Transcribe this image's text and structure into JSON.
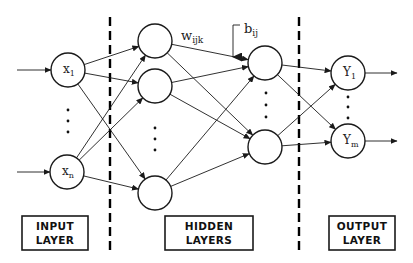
{
  "diagram": {
    "colors": {
      "stroke": "#1a1a1a",
      "background": "#ffffff"
    },
    "node_radius": 17,
    "layers": [
      {
        "id": "input",
        "box_label_line1": "INPUT",
        "box_label_line2": "LAYER",
        "box": {
          "x": 22,
          "y": 216,
          "w": 66,
          "h": 34
        },
        "nodes": [
          {
            "id": "x1",
            "cx": 68,
            "cy": 70,
            "label": "x",
            "sub": "1"
          },
          {
            "id": "xn",
            "cx": 67,
            "cy": 172,
            "label": "x",
            "sub": "n"
          }
        ],
        "ellipsis": {
          "x": 68,
          "ys": [
            110,
            121,
            132
          ]
        }
      },
      {
        "id": "hidden",
        "box_label_line1": "HIDDEN",
        "box_label_line2": "LAYERS",
        "box": {
          "x": 165,
          "y": 216,
          "w": 88,
          "h": 34
        },
        "sublayers": [
          {
            "nodes": [
              {
                "id": "h1a",
                "cx": 155,
                "cy": 41
              },
              {
                "id": "h1b",
                "cx": 155,
                "cy": 86
              },
              {
                "id": "h1c",
                "cx": 155,
                "cy": 193
              }
            ],
            "ellipsis": {
              "x": 155,
              "ys": [
                128,
                139,
                150
              ]
            }
          },
          {
            "nodes": [
              {
                "id": "h2a",
                "cx": 265,
                "cy": 63
              },
              {
                "id": "h2b",
                "cx": 265,
                "cy": 147
              }
            ],
            "ellipsis": {
              "x": 266,
              "ys": [
                93,
                105,
                117
              ]
            }
          }
        ]
      },
      {
        "id": "output",
        "box_label_line1": "OUTPUT",
        "box_label_line2": "LAYER",
        "box": {
          "x": 329,
          "y": 216,
          "w": 66,
          "h": 34
        },
        "nodes": [
          {
            "id": "y1",
            "cx": 348,
            "cy": 73,
            "label": "Y",
            "sub": "1"
          },
          {
            "id": "ym",
            "cx": 348,
            "cy": 141,
            "label": "Y",
            "sub": "m"
          }
        ],
        "ellipsis": {
          "x": 348,
          "ys": [
            97,
            107,
            118
          ]
        }
      }
    ],
    "weight_label": {
      "main": "w",
      "sub": "ijk",
      "x": 181,
      "y": 40
    },
    "bias_label": {
      "main": "b",
      "sub": "ij",
      "x": 244,
      "y": 33
    },
    "dividers": [
      {
        "x": 110,
        "y1": 17,
        "y2": 252
      },
      {
        "x": 299,
        "y1": 17,
        "y2": 252
      }
    ],
    "input_arrows": [
      {
        "x1": 17,
        "y1": 70,
        "x2": 51,
        "y2": 70
      },
      {
        "x1": 17,
        "y1": 172,
        "x2": 50,
        "y2": 172
      }
    ],
    "output_arrows": [
      {
        "x1": 365,
        "y1": 73,
        "x2": 397,
        "y2": 73
      },
      {
        "x1": 365,
        "y1": 141,
        "x2": 397,
        "y2": 141
      }
    ],
    "connections": [
      [
        "x1",
        "h1a"
      ],
      [
        "x1",
        "h1b"
      ],
      [
        "x1",
        "h1c"
      ],
      [
        "xn",
        "h1a"
      ],
      [
        "xn",
        "h1b"
      ],
      [
        "xn",
        "h1c"
      ],
      [
        "h1a",
        "h2a"
      ],
      [
        "h1a",
        "h2b"
      ],
      [
        "h1b",
        "h2a"
      ],
      [
        "h1b",
        "h2b"
      ],
      [
        "h1c",
        "h2a"
      ],
      [
        "h1c",
        "h2b"
      ],
      [
        "h2a",
        "y1"
      ],
      [
        "h2a",
        "ym"
      ],
      [
        "h2b",
        "y1"
      ],
      [
        "h2b",
        "ym"
      ]
    ],
    "bias_arrow": {
      "start_x": 240,
      "start_y": 25,
      "corner_x": 233,
      "end_y": 57
    }
  }
}
